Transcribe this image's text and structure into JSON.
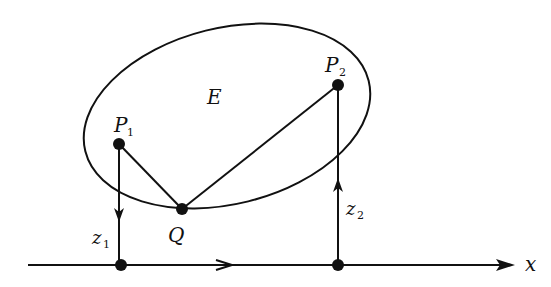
{
  "diagram": {
    "region_label": "E",
    "points": {
      "p1": {
        "label": "P",
        "sub": "1"
      },
      "p2": {
        "label": "P",
        "sub": "2"
      },
      "q": {
        "label": "Q"
      }
    },
    "heights": {
      "z1": {
        "label": "z",
        "sub": "1"
      },
      "z2": {
        "label": "z",
        "sub": "2"
      }
    },
    "axis": {
      "label": "x"
    },
    "colors": {
      "stroke": "#111111",
      "background": "#ffffff"
    }
  }
}
